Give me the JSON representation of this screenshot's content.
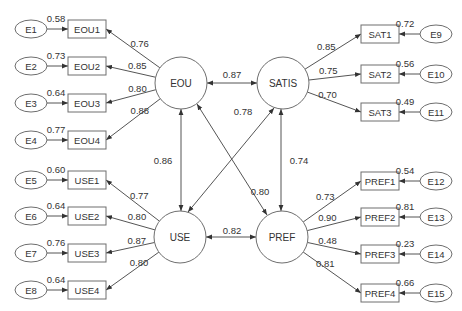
{
  "colors": {
    "stroke": "#6e6e6e",
    "line": "#555555",
    "text": "#333333",
    "background": "#ffffff"
  },
  "latents": [
    {
      "id": "EOU",
      "label": "EOU",
      "cx": 181,
      "cy": 83,
      "r": 26
    },
    {
      "id": "SATIS",
      "label": "SATIS",
      "cx": 283,
      "cy": 83,
      "r": 26
    },
    {
      "id": "USE",
      "label": "USE",
      "cx": 180,
      "cy": 237,
      "r": 26
    },
    {
      "id": "PREF",
      "label": "PREF",
      "cx": 282,
      "cy": 237,
      "r": 26
    }
  ],
  "indicators": [
    {
      "id": "EOU1",
      "label": "EOU1",
      "side": "left",
      "y": 29,
      "latent": "EOU",
      "loading": "0.76",
      "error": "E1",
      "error_value": "0.58"
    },
    {
      "id": "EOU2",
      "label": "EOU2",
      "side": "left",
      "y": 66,
      "latent": "EOU",
      "loading": "0.85",
      "error": "E2",
      "error_value": "0.73"
    },
    {
      "id": "EOU3",
      "label": "EOU3",
      "side": "left",
      "y": 103,
      "latent": "EOU",
      "loading": "0.80",
      "error": "E3",
      "error_value": "0.64"
    },
    {
      "id": "EOU4",
      "label": "EOU4",
      "side": "left",
      "y": 140,
      "latent": "EOU",
      "loading": "0.88",
      "error": "E4",
      "error_value": "0.77"
    },
    {
      "id": "USE1",
      "label": "USE1",
      "side": "left",
      "y": 180,
      "latent": "USE",
      "loading": "0.77",
      "error": "E5",
      "error_value": "0.60"
    },
    {
      "id": "USE2",
      "label": "USE2",
      "side": "left",
      "y": 216,
      "latent": "USE",
      "loading": "0.80",
      "error": "E6",
      "error_value": "0.64"
    },
    {
      "id": "USE3",
      "label": "USE3",
      "side": "left",
      "y": 253,
      "latent": "USE",
      "loading": "0.87",
      "error": "E7",
      "error_value": "0.76"
    },
    {
      "id": "USE4",
      "label": "USE4",
      "side": "left",
      "y": 290,
      "latent": "USE",
      "loading": "0.80",
      "error": "E8",
      "error_value": "0.64"
    },
    {
      "id": "SAT1",
      "label": "SAT1",
      "side": "right",
      "y": 34,
      "latent": "SATIS",
      "loading": "0.85",
      "error": "E9",
      "error_value": "0.72"
    },
    {
      "id": "SAT2",
      "label": "SAT2",
      "side": "right",
      "y": 74,
      "latent": "SATIS",
      "loading": "0.75",
      "error": "E10",
      "error_value": "0.56"
    },
    {
      "id": "SAT3",
      "label": "SAT3",
      "side": "right",
      "y": 112,
      "latent": "SATIS",
      "loading": "0.70",
      "error": "E11",
      "error_value": "0.49"
    },
    {
      "id": "PREF1",
      "label": "PREF1",
      "side": "right",
      "y": 181,
      "latent": "PREF",
      "loading": "0.73",
      "error": "E12",
      "error_value": "0.54"
    },
    {
      "id": "PREF2",
      "label": "PREF2",
      "side": "right",
      "y": 217,
      "latent": "PREF",
      "loading": "0.90",
      "error": "E13",
      "error_value": "0.81"
    },
    {
      "id": "PREF3",
      "label": "PREF3",
      "side": "right",
      "y": 254,
      "latent": "PREF",
      "loading": "0.48",
      "error": "E14",
      "error_value": "0.23"
    },
    {
      "id": "PREF4",
      "label": "PREF4",
      "side": "right",
      "y": 293,
      "latent": "PREF",
      "loading": "0.81",
      "error": "E15",
      "error_value": "0.66"
    }
  ],
  "correlations": [
    {
      "from": "EOU",
      "to": "SATIS",
      "value": "0.87",
      "lx": 232,
      "ly": 74
    },
    {
      "from": "USE",
      "to": "PREF",
      "value": "0.82",
      "lx": 232,
      "ly": 230
    },
    {
      "from": "EOU",
      "to": "USE",
      "value": "0.86",
      "lx": 163,
      "ly": 160
    },
    {
      "from": "SATIS",
      "to": "PREF",
      "value": "0.74",
      "lx": 299,
      "ly": 160
    },
    {
      "from": "USE",
      "to": "SATIS",
      "value": "0.78",
      "lx": 243,
      "ly": 111
    },
    {
      "from": "EOU",
      "to": "PREF",
      "value": "0.80",
      "lx": 260,
      "ly": 191
    }
  ]
}
